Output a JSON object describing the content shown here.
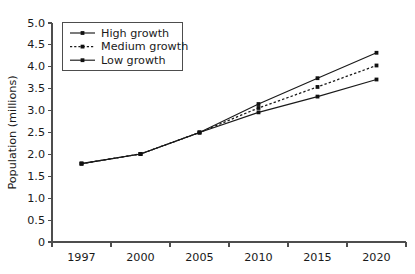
{
  "chart_data": {
    "type": "line",
    "title": "",
    "xlabel": "",
    "ylabel": "Population (millions)",
    "categories": [
      "1997",
      "2000",
      "2005",
      "2010",
      "2015",
      "2020"
    ],
    "ylim": [
      0,
      5.0
    ],
    "yticks": [
      "0",
      "0.5",
      "1.0",
      "1.5",
      "2.0",
      "2.5",
      "3.0",
      "3.5",
      "4.0",
      "4.5",
      "5.0"
    ],
    "ytick_values": [
      0,
      0.5,
      1.0,
      1.5,
      2.0,
      2.5,
      3.0,
      3.5,
      4.0,
      4.5,
      5.0
    ],
    "grid": false,
    "legend_position": "top-left",
    "series": [
      {
        "name": "High growth",
        "style": "solid",
        "marker": "square",
        "values": [
          1.79,
          2.01,
          2.5,
          3.15,
          3.74,
          4.32
        ]
      },
      {
        "name": "Medium growth",
        "style": "dashed",
        "marker": "square",
        "values": [
          1.79,
          2.01,
          2.5,
          3.06,
          3.54,
          4.03
        ]
      },
      {
        "name": "Low growth",
        "style": "solid",
        "marker": "square",
        "values": [
          1.79,
          2.01,
          2.5,
          2.96,
          3.32,
          3.71
        ]
      }
    ]
  },
  "colors": {
    "line": "#1a1a1a",
    "axis": "#4d4d4d",
    "text": "#1a1a1a",
    "background": "#ffffff"
  }
}
